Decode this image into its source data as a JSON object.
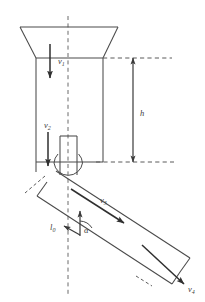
{
  "figure": {
    "background_color": "#ffffff",
    "line_color": "#4a4a4a",
    "vector_color": "#2f2f2f",
    "labels": {
      "v1": {
        "symbol": "v",
        "subscript": "1",
        "x": 58,
        "y": 64,
        "meaning": "velocity in upper column"
      },
      "v2": {
        "symbol": "v",
        "subscript": "2",
        "x": 48,
        "y": 128,
        "meaning": "velocity at nozzle"
      },
      "v3": {
        "symbol": "v",
        "subscript": "3",
        "x": 104,
        "y": 200,
        "meaning": "velocity along chute"
      },
      "v4": {
        "symbol": "v",
        "subscript": "4",
        "x": 190,
        "y": 288,
        "meaning": "exit velocity"
      },
      "h": {
        "symbol": "h",
        "subscript": "",
        "x": 143,
        "y": 116,
        "meaning": "column height"
      },
      "l0": {
        "symbol": "l",
        "subscript": "0",
        "x": 55,
        "y": 228,
        "meaning": "chute length"
      },
      "alpha": {
        "symbol": "α",
        "subscript": "",
        "x": 85,
        "y": 230,
        "meaning": "chute inclination angle"
      }
    }
  },
  "geometry": {
    "centerline": {
      "x": 68,
      "y_top": 16,
      "y_bottom": 296
    },
    "funnel": {
      "top_left_x": 20,
      "top_right_x": 118,
      "top_y": 27,
      "bottom_left_x": 36,
      "bottom_right_x": 103,
      "bottom_y": 58
    },
    "column": {
      "left_x": 36,
      "right_x": 103,
      "top_y": 58,
      "bottom_y": 162
    },
    "nozzle": {
      "left_x": 60,
      "right_x": 77,
      "top_y": 136,
      "bottom_y": 172
    },
    "arc": {
      "cx": 68,
      "cy": 166,
      "r": 14
    },
    "chute": {
      "angle_deg": 33,
      "near_top_x": 40,
      "near_top_y": 173,
      "far_end_x": 176,
      "far_end_y": 265,
      "width": 34
    },
    "height_dim": {
      "x": 133,
      "y_top": 58,
      "y_bottom": 162
    },
    "ref_line_top": {
      "x1": 103,
      "x2": 170,
      "y": 58
    },
    "ref_line_bottom": {
      "x1": 96,
      "x2": 172,
      "y": 162
    }
  }
}
